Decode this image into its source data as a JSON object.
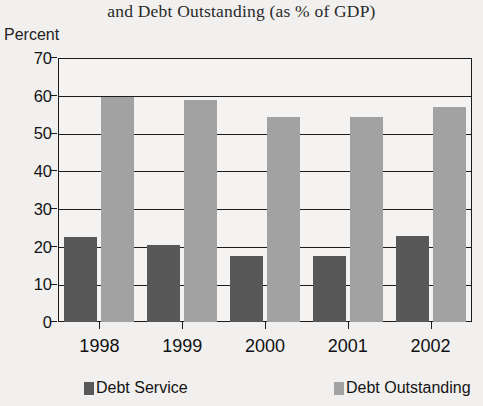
{
  "chart_data": {
    "type": "bar",
    "title": "and Debt Outstanding (as % of GDP)",
    "xlabel": "",
    "ylabel": "Percent",
    "categories": [
      "1998",
      "1999",
      "2000",
      "2001",
      "2002"
    ],
    "series": [
      {
        "name": "Debt Service",
        "color": "#585858",
        "values": [
          22.5,
          20.5,
          17.5,
          17.4,
          22.8
        ]
      },
      {
        "name": "Debt Outstanding",
        "color": "#a2a2a2",
        "values": [
          59.6,
          59.0,
          54.4,
          54.4,
          57.1
        ]
      }
    ],
    "ylim": [
      0,
      70
    ],
    "yticks": [
      0,
      10,
      20,
      30,
      40,
      50,
      60,
      70
    ],
    "ytick_labels": [
      "0",
      "10",
      "20",
      "30",
      "40",
      "50",
      "60",
      "70"
    ],
    "grid": "horizontal",
    "legend_position": "bottom",
    "background_color": "#f1f0ee",
    "axis_color": "#1c1c1c"
  },
  "axis": {
    "y_title": "Percent"
  },
  "legend": {
    "items": [
      {
        "label": "Debt Service"
      },
      {
        "label": "Debt Outstanding"
      }
    ]
  }
}
